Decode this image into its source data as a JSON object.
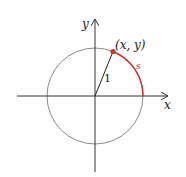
{
  "diagram": {
    "type": "unit-circle",
    "labels": {
      "x_axis": "x",
      "y_axis": "y",
      "point": "(x, y)",
      "radius": "1",
      "arc": "s"
    },
    "colors": {
      "axes": "#333333",
      "circle": "#8a8a8a",
      "arc": "#d0342c",
      "point": "#d0342c",
      "radius": "#222222"
    }
  }
}
